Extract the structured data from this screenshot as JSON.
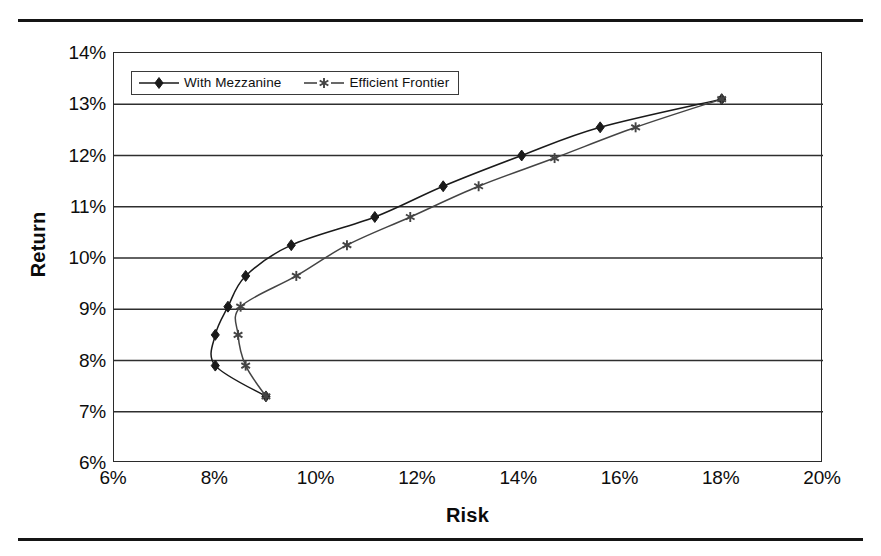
{
  "chart_data": {
    "type": "line",
    "title": "",
    "xlabel": "Risk",
    "ylabel": "Return",
    "xlim": [
      6,
      20
    ],
    "ylim": [
      6,
      14
    ],
    "xticks": [
      "6%",
      "8%",
      "10%",
      "12%",
      "14%",
      "16%",
      "18%",
      "20%"
    ],
    "xtick_values": [
      6,
      8,
      10,
      12,
      14,
      16,
      18,
      20
    ],
    "yticks": [
      "6%",
      "7%",
      "8%",
      "9%",
      "10%",
      "11%",
      "12%",
      "13%",
      "14%"
    ],
    "ytick_values": [
      6,
      7,
      8,
      9,
      10,
      11,
      12,
      13,
      14
    ],
    "grid": "horizontal",
    "legend_position": "top-left",
    "x_unit": "%",
    "y_unit": "%",
    "series": [
      {
        "name": "With Mezzanine",
        "marker": "diamond",
        "color": "#1a1a1a",
        "points": [
          [
            9.0,
            7.3
          ],
          [
            8.0,
            7.9
          ],
          [
            8.0,
            8.5
          ],
          [
            8.25,
            9.05
          ],
          [
            8.6,
            9.65
          ],
          [
            9.5,
            10.25
          ],
          [
            11.15,
            10.8
          ],
          [
            12.5,
            11.4
          ],
          [
            14.05,
            12.0
          ],
          [
            15.6,
            12.55
          ],
          [
            18.0,
            13.1
          ]
        ]
      },
      {
        "name": "Efficient Frontier",
        "marker": "star",
        "color": "#444444",
        "points": [
          [
            9.0,
            7.3
          ],
          [
            8.6,
            7.9
          ],
          [
            8.45,
            8.5
          ],
          [
            8.5,
            9.05
          ],
          [
            9.6,
            9.65
          ],
          [
            10.6,
            10.25
          ],
          [
            11.85,
            10.8
          ],
          [
            13.2,
            11.4
          ],
          [
            14.7,
            11.95
          ],
          [
            16.3,
            12.55
          ],
          [
            18.0,
            13.1
          ]
        ]
      }
    ]
  },
  "legend": {
    "entries": [
      {
        "label": "With Mezzanine"
      },
      {
        "label": "Efficient Frontier"
      }
    ]
  },
  "axes": {
    "x_title": "Risk",
    "y_title": "Return"
  }
}
